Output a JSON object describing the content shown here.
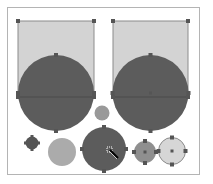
{
  "canvas": {
    "width": 213,
    "height": 184,
    "background": "#ffffff",
    "frame": {
      "x": 7.5,
      "y": 7.5,
      "width": 192,
      "height": 167,
      "stroke": "#b4b4b4",
      "fill": "#ffffff"
    }
  },
  "colors": {
    "rect_fill": "#d3d3d3",
    "rect_stroke": "#8c8c8c",
    "dark_fill": "#5c5c5c",
    "medium_fill": "#8f8f8f",
    "light_fill": "#ababab",
    "pale_fill": "#d6d6d6",
    "pale_stroke": "#8a8a8a",
    "handle": "#555555",
    "divider": "#4a4a4a"
  },
  "shapes": [
    {
      "id": "left-rect",
      "type": "rect",
      "x": 18,
      "y": 21,
      "width": 76,
      "height": 76,
      "fill": "#d3d3d3",
      "stroke": "#8c8c8c",
      "selected": true
    },
    {
      "id": "right-rect",
      "type": "rect",
      "x": 113,
      "y": 21,
      "width": 75,
      "height": 76,
      "fill": "#d3d3d3",
      "stroke": "#8c8c8c",
      "selected": true
    },
    {
      "id": "left-large-circle",
      "type": "circle",
      "cx": 56,
      "cy": 93,
      "r": 38,
      "fill": "#5c5c5c",
      "stroke": "none",
      "selected": true,
      "center_handle": false
    },
    {
      "id": "right-large-circle",
      "type": "circle",
      "cx": 150.5,
      "cy": 93,
      "r": 38,
      "fill": "#5c5c5c",
      "stroke": "none",
      "selected": true,
      "center_handle": true
    },
    {
      "id": "small-center-circle",
      "type": "circle",
      "cx": 102,
      "cy": 113,
      "r": 7.5,
      "fill": "#999999",
      "stroke": "none",
      "selected": false,
      "center_handle": false
    },
    {
      "id": "small-dark-circle",
      "type": "circle",
      "cx": 32,
      "cy": 143,
      "r": 6.5,
      "fill": "#555555",
      "stroke": "none",
      "selected": true,
      "center_handle": false
    },
    {
      "id": "light-gray-circle",
      "type": "circle",
      "cx": 62,
      "cy": 152,
      "r": 14,
      "fill": "#ababab",
      "stroke": "none",
      "selected": false,
      "center_handle": false
    },
    {
      "id": "bottom-dark-circle",
      "type": "circle",
      "cx": 104,
      "cy": 149,
      "r": 22,
      "fill": "#5c5c5c",
      "stroke": "none",
      "selected": true,
      "center_handle": false
    },
    {
      "id": "medium-gray-circle",
      "type": "circle",
      "cx": 145,
      "cy": 152,
      "r": 11,
      "fill": "#8f8f8f",
      "stroke": "none",
      "selected": true,
      "center_handle": true
    },
    {
      "id": "pale-outlined-circle",
      "type": "circle",
      "cx": 172,
      "cy": 151,
      "r": 13.5,
      "fill": "#d6d6d6",
      "stroke": "#8a8a8a",
      "selected": true,
      "center_handle": true
    }
  ],
  "dividers": [
    {
      "id": "left-equator-line",
      "x1": 18,
      "y1": 97,
      "x2": 94,
      "y2": 97
    },
    {
      "id": "right-equator-line",
      "x1": 113,
      "y1": 97,
      "x2": 188,
      "y2": 97
    }
  ],
  "extra_handles": [
    {
      "id": "left-circle-side-handle-l2",
      "x": 18,
      "y": 97
    },
    {
      "id": "left-circle-side-handle-r2",
      "x": 94,
      "y": 97
    },
    {
      "id": "right-circle-side-handle-l2",
      "x": 113,
      "y": 97
    },
    {
      "id": "right-circle-side-handle-r2",
      "x": 188,
      "y": 97
    }
  ],
  "cursor": {
    "icon": "pen-move-cursor-icon",
    "x": 110,
    "y": 150
  }
}
